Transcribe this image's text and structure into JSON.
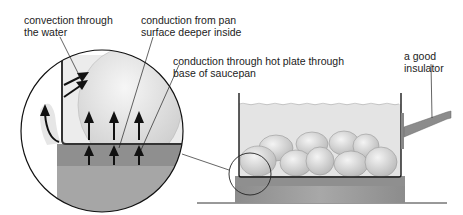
{
  "labels": {
    "convection_line1": "convection through",
    "convection_line2": "the water",
    "conduction_pan_line1": "conduction from pan",
    "conduction_pan_line2": "surface deeper inside",
    "conduction_plate_line1": "conduction through hot plate through",
    "conduction_plate_line2": "base of saucepan",
    "insulator_line1": "a good",
    "insulator_line2": "insulator"
  },
  "colors": {
    "water": "#e6e6e6",
    "potato": "#d4d4d4",
    "hotplate_top": "#8f8f8f",
    "hotplate_body": "#9d9d9d",
    "handle": "#8a8a8a",
    "outline": "#1a1a1a"
  }
}
